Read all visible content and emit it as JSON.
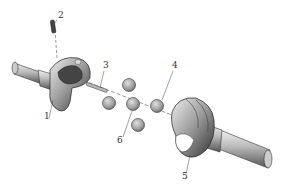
{
  "diagram": {
    "type": "exploded-view",
    "parts": [
      {
        "id": "1",
        "label": "1",
        "x": 45,
        "y": 119
      },
      {
        "id": "2",
        "label": "2",
        "x": 58,
        "y": 17
      },
      {
        "id": "3",
        "label": "3",
        "x": 104,
        "y": 68
      },
      {
        "id": "4",
        "label": "4",
        "x": 173,
        "y": 67
      },
      {
        "id": "5",
        "label": "5",
        "x": 183,
        "y": 177
      },
      {
        "id": "6",
        "label": "6",
        "x": 119,
        "y": 140
      }
    ],
    "colors": {
      "line": "#333333",
      "shade_dark": "#555555",
      "shade_mid": "#999999",
      "shade_light": "#dddddd",
      "background": "#ffffff"
    }
  }
}
